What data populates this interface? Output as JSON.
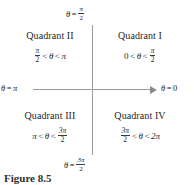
{
  "figure": {
    "caption": "Figure 8.5",
    "axes": {
      "top_label": {
        "theta": "θ",
        "equals": "=",
        "num": "π",
        "den": "2"
      },
      "bottom_label": {
        "theta": "θ",
        "equals": "=",
        "num": "3π",
        "den": "2"
      },
      "left_label": {
        "theta": "θ",
        "equals": "=",
        "value": "π"
      },
      "right_label": {
        "theta": "θ",
        "equals": "=",
        "value": "0"
      }
    },
    "quadrants": [
      {
        "id": "quadrant-1",
        "name": "Quadrant I",
        "range": {
          "left_value": "0",
          "left_op": "<",
          "theta": "θ",
          "right_op": "<",
          "right_num": "π",
          "right_den": "2"
        }
      },
      {
        "id": "quadrant-2",
        "name": "Quadrant II",
        "range": {
          "left_num": "π",
          "left_den": "2",
          "left_op": "<",
          "theta": "θ",
          "right_op": "<",
          "right_value": "π"
        }
      },
      {
        "id": "quadrant-3",
        "name": "Quadrant III",
        "range": {
          "left_value": "π",
          "left_op": "<",
          "theta": "θ",
          "right_op": "<",
          "right_num": "3π",
          "right_den": "2"
        }
      },
      {
        "id": "quadrant-4",
        "name": "Quadrant IV",
        "range": {
          "left_num": "3π",
          "left_den": "2",
          "left_op": "<",
          "theta": "θ",
          "right_op": "<",
          "right_value": "2π"
        }
      }
    ],
    "colors": {
      "axis": "#9a9a9a",
      "text": "#1f1f1f",
      "background": "#ffffff"
    }
  }
}
